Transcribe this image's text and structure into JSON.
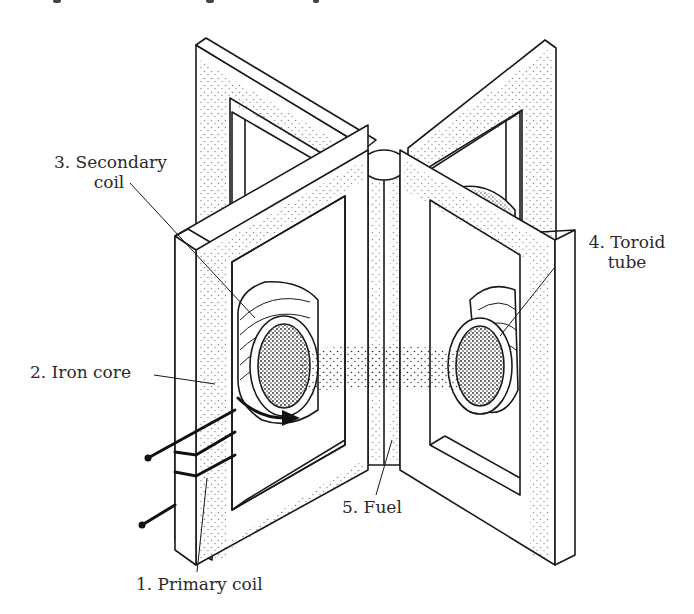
{
  "figure": {
    "colors": {
      "ink": "#1a1a1a",
      "background": "#ffffff",
      "label": "#2a2a2a"
    }
  },
  "labels": {
    "secondary_coil_line1": "3. Secondary",
    "secondary_coil_line2": "coil",
    "toroid_tube_line1": "4. Toroid",
    "toroid_tube_line2": "tube",
    "iron_core": "2. Iron core",
    "fuel": "5. Fuel",
    "primary_coil": "1. Primary coil"
  }
}
